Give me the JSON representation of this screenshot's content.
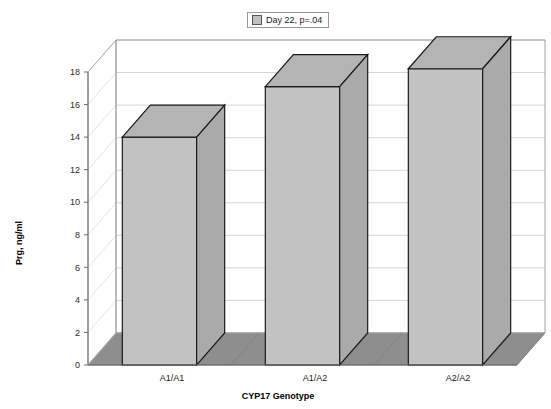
{
  "chart_data": {
    "type": "bar",
    "title": "",
    "categories": [
      "A1/A1",
      "A1/A2",
      "A2/A2"
    ],
    "values": [
      14.0,
      17.1,
      18.2
    ],
    "series": [
      {
        "name": "Day 22, p=.04",
        "values": [
          14.0,
          17.1,
          18.2
        ]
      }
    ],
    "xlabel": "CYP17 Genotype",
    "ylabel": "Prg, ng/ml",
    "ylim": [
      0,
      18
    ],
    "yticks": [
      0,
      2,
      4,
      6,
      8,
      10,
      12,
      14,
      16,
      18
    ],
    "ytick_labels": [
      "0",
      "2",
      "4",
      "6",
      "8",
      "10",
      "12",
      "14",
      "16",
      "18"
    ],
    "grid": true,
    "legend_position": "top-center",
    "style": "3d-bar",
    "bar_color": "#c2c2c2",
    "bar_top_color": "#b4b4b4",
    "bar_side_color": "#aaaaaa",
    "bar_edge_color": "#1a1a1a",
    "floor_color": "#8e8e8e",
    "grid_color": "#cfcfcf",
    "axis_color": "#6e6e6e"
  },
  "legend": {
    "entries": [
      {
        "label": "Day 22, p=.04",
        "swatch_color": "#c0c0c0"
      }
    ]
  },
  "axes": {
    "y_title": "Prg, ng/ml",
    "x_title": "CYP17 Genotype"
  }
}
